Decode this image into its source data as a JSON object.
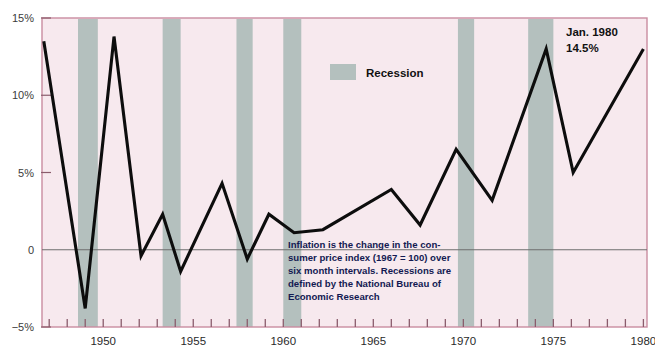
{
  "chart_data": {
    "type": "line",
    "title": "",
    "xlabel": "",
    "ylabel": "",
    "xlim": [
      1946.6,
      1980.2
    ],
    "ylim": [
      -5,
      15
    ],
    "grid": false,
    "legend_position": "top-center",
    "y_ticks": [
      {
        "value": 15,
        "label": "15%"
      },
      {
        "value": 10,
        "label": "10%"
      },
      {
        "value": 5,
        "label": "5%"
      },
      {
        "value": 0,
        "label": "0"
      },
      {
        "value": -5,
        "label": "−5%"
      }
    ],
    "x_ticks_major": [
      1950,
      1955,
      1960,
      1965,
      1970,
      1975,
      1980
    ],
    "x_ticks_minor_step": 1,
    "x_tick_labels": [
      "1950",
      "1955",
      "1960",
      "1965",
      "1970",
      "1975",
      "1980"
    ],
    "series": [
      {
        "name": "Inflation",
        "color": "#0d0d0d",
        "x": [
          1946.7,
          1949.0,
          1950.6,
          1952.1,
          1953.3,
          1954.3,
          1956.6,
          1958.0,
          1959.2,
          1960.6,
          1962.2,
          1966.0,
          1967.6,
          1969.6,
          1971.6,
          1974.6,
          1976.1,
          1980.0
        ],
        "values": [
          13.5,
          -3.8,
          13.8,
          -0.4,
          2.3,
          -1.4,
          4.3,
          -0.6,
          2.3,
          1.1,
          1.3,
          3.9,
          1.6,
          6.5,
          3.2,
          13.0,
          5.0,
          13.0
        ]
      }
    ],
    "recessions": [
      {
        "start": 1948.6,
        "end": 1949.7
      },
      {
        "start": 1953.3,
        "end": 1954.3
      },
      {
        "start": 1957.4,
        "end": 1958.3
      },
      {
        "start": 1960.0,
        "end": 1961.0
      },
      {
        "start": 1969.7,
        "end": 1970.6
      },
      {
        "start": 1973.6,
        "end": 1975.0
      }
    ],
    "legend": [
      {
        "label": "Recession",
        "color": "#b4c0be"
      }
    ],
    "annotations": [
      {
        "name": "peak-callout",
        "lines": [
          "Jan. 1980",
          "14.5%"
        ],
        "x": 1977.4,
        "y": 14.1
      }
    ],
    "note": {
      "lines": [
        "Inflation is the change in the con-",
        "sumer price index (1967 = 100) over",
        "six month intervals. Recessions are",
        "defined by the National Bureau of",
        "Economic Research"
      ]
    },
    "colors": {
      "plot_background": "#f7e9ee",
      "recession_band": "#b4c0be",
      "line": "#0d0d0d",
      "frame": "#c98ca0",
      "zero_line": "#6e6e6e",
      "tick": "#8a5c6c",
      "note_text": "#131a52",
      "page_background": "#ffffff"
    }
  }
}
